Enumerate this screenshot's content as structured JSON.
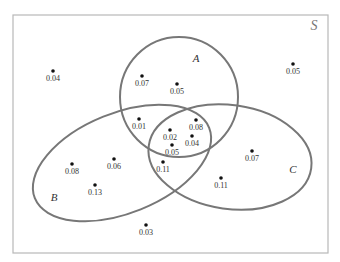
{
  "diagram": {
    "type": "venn",
    "universe": {
      "label": "S",
      "x": 13,
      "y": 15,
      "width": 315,
      "height": 238
    },
    "sets": [
      {
        "id": "A",
        "label": "A",
        "shape": "circle",
        "cx": 179,
        "cy": 97,
        "rx": 59,
        "ry": 60,
        "rotate": 0,
        "label_x": 196,
        "label_y": 62
      },
      {
        "id": "B",
        "label": "B",
        "shape": "ellipse",
        "cx": 122,
        "cy": 163,
        "rx": 94,
        "ry": 50,
        "rotate": -22,
        "label_x": 54,
        "label_y": 201
      },
      {
        "id": "C",
        "label": "C",
        "shape": "ellipse",
        "cx": 230,
        "cy": 157,
        "rx": 82,
        "ry": 52,
        "rotate": 8,
        "label_x": 293,
        "label_y": 173
      }
    ],
    "points": [
      {
        "value": "0.04",
        "x": 53,
        "y": 71,
        "region": "none"
      },
      {
        "value": "0.07",
        "x": 142,
        "y": 76,
        "region": "A only"
      },
      {
        "value": "0.05",
        "x": 177,
        "y": 84,
        "region": "A only"
      },
      {
        "value": "0.05",
        "x": 293,
        "y": 64,
        "region": "none"
      },
      {
        "value": "0.01",
        "x": 139,
        "y": 119,
        "region": "A and B"
      },
      {
        "value": "0.08",
        "x": 196,
        "y": 120,
        "region": "A and C"
      },
      {
        "value": "0.02",
        "x": 170,
        "y": 130,
        "region": "A and B and C"
      },
      {
        "value": "0.04",
        "x": 192,
        "y": 136,
        "region": "A and C"
      },
      {
        "value": "0.05",
        "x": 172,
        "y": 145,
        "region": "A and B and C"
      },
      {
        "value": "0.08",
        "x": 72,
        "y": 164,
        "region": "B only"
      },
      {
        "value": "0.06",
        "x": 114,
        "y": 159,
        "region": "B only"
      },
      {
        "value": "0.11",
        "x": 163,
        "y": 162,
        "region": "B and C"
      },
      {
        "value": "0.07",
        "x": 252,
        "y": 151,
        "region": "C only"
      },
      {
        "value": "0.13",
        "x": 95,
        "y": 185,
        "region": "B only"
      },
      {
        "value": "0.11",
        "x": 221,
        "y": 178,
        "region": "C only"
      },
      {
        "value": "0.03",
        "x": 146,
        "y": 225,
        "region": "none"
      }
    ]
  }
}
